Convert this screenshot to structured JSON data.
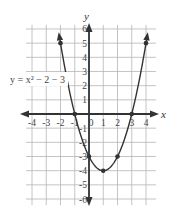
{
  "chart_data": {
    "type": "line",
    "title": "",
    "equation_label": "y = x² − 2 − 3",
    "xlabel": "x",
    "ylabel": "y",
    "xlim": [
      -4,
      4
    ],
    "ylim": [
      -6,
      6
    ],
    "x_ticks": [
      "-4",
      "-3",
      "-2",
      "-1",
      "0",
      "1",
      "2",
      "3",
      "4"
    ],
    "y_ticks": [
      "6",
      "5",
      "4",
      "3",
      "2",
      "1",
      "-1",
      "-2",
      "-3",
      "-4",
      "-5",
      "-6"
    ],
    "grid": true,
    "series": [
      {
        "name": "y = x² − 2x − 3",
        "points": [
          [
            -2,
            5
          ],
          [
            -1,
            0
          ],
          [
            0,
            -3
          ],
          [
            1,
            -4
          ],
          [
            2,
            -3
          ],
          [
            3,
            0
          ],
          [
            4,
            5
          ]
        ],
        "arrows_at_ends": true
      }
    ],
    "marked_points": [
      [
        -2,
        5
      ],
      [
        -1,
        0
      ],
      [
        0,
        -3
      ],
      [
        1,
        -4
      ],
      [
        2,
        -3
      ],
      [
        3,
        0
      ],
      [
        4,
        5
      ]
    ]
  },
  "colors": {
    "grid": "#b5b5b5",
    "axes": "#333333",
    "curve": "#333333"
  }
}
